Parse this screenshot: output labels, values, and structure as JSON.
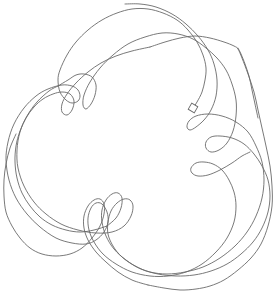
{
  "drawing": {
    "background": "#ffffff",
    "stroke_color": "#6a6a6a",
    "start_marker": {
      "shape": "square",
      "x": 193,
      "y": 108,
      "size": 7,
      "rotation": 30
    },
    "paths": [
      {
        "name": "top-arcs-to-left-loops",
        "points": [
          [
            193,
            108
          ],
          [
            197,
            102
          ],
          [
            202,
            92
          ],
          [
            205,
            80
          ],
          [
            206,
            68
          ],
          [
            203,
            55
          ],
          [
            197,
            42
          ],
          [
            188,
            30
          ],
          [
            177,
            20
          ],
          [
            163,
            13
          ],
          [
            148,
            9
          ],
          [
            132,
            9
          ],
          [
            117,
            13
          ],
          [
            102,
            20
          ],
          [
            88,
            30
          ],
          [
            76,
            42
          ],
          [
            67,
            55
          ],
          [
            60,
            70
          ],
          [
            58,
            80
          ],
          [
            60,
            92
          ],
          [
            66,
            100
          ],
          [
            72,
            103
          ],
          [
            78,
            101
          ],
          [
            80,
            96
          ],
          [
            78,
            90
          ],
          [
            72,
            86
          ],
          [
            62,
            85
          ],
          [
            48,
            89
          ],
          [
            36,
            96
          ],
          [
            24,
            108
          ],
          [
            14,
            124
          ],
          [
            8,
            142
          ],
          [
            6,
            160
          ],
          [
            9,
            180
          ],
          [
            16,
            198
          ],
          [
            27,
            214
          ],
          [
            40,
            227
          ],
          [
            56,
            238
          ],
          [
            72,
            243
          ],
          [
            86,
            244
          ],
          [
            96,
            240
          ],
          [
            104,
            232
          ],
          [
            108,
            222
          ],
          [
            107,
            212
          ],
          [
            102,
            204
          ],
          [
            96,
            203
          ],
          [
            91,
            208
          ],
          [
            88,
            218
          ],
          [
            89,
            230
          ],
          [
            94,
            242
          ],
          [
            103,
            254
          ],
          [
            116,
            264
          ],
          [
            132,
            272
          ],
          [
            150,
            276
          ],
          [
            168,
            276
          ],
          [
            186,
            272
          ],
          [
            202,
            264
          ],
          [
            216,
            252
          ],
          [
            227,
            238
          ],
          [
            234,
            222
          ],
          [
            236,
            206
          ],
          [
            234,
            192
          ],
          [
            229,
            180
          ],
          [
            222,
            170
          ],
          [
            213,
            164
          ],
          [
            204,
            162
          ],
          [
            196,
            163
          ],
          [
            191,
            168
          ],
          [
            192,
            173
          ],
          [
            198,
            176
          ],
          [
            208,
            175
          ],
          [
            220,
            170
          ],
          [
            232,
            163
          ],
          [
            242,
            156
          ],
          [
            250,
            152
          ]
        ]
      },
      {
        "name": "second-sweep",
        "points": [
          [
            125,
            4
          ],
          [
            140,
            4
          ],
          [
            156,
            7
          ],
          [
            172,
            14
          ],
          [
            186,
            24
          ],
          [
            198,
            36
          ],
          [
            208,
            50
          ],
          [
            214,
            64
          ],
          [
            217,
            80
          ],
          [
            216,
            96
          ],
          [
            211,
            110
          ],
          [
            204,
            120
          ],
          [
            196,
            127
          ],
          [
            190,
            130
          ],
          [
            187,
            127
          ],
          [
            189,
            121
          ],
          [
            196,
            116
          ],
          [
            208,
            114
          ],
          [
            222,
            116
          ],
          [
            236,
            122
          ],
          [
            248,
            132
          ],
          [
            256,
            146
          ],
          [
            262,
            162
          ],
          [
            264,
            180
          ],
          [
            262,
            198
          ],
          [
            256,
            216
          ],
          [
            247,
            232
          ],
          [
            235,
            246
          ],
          [
            220,
            258
          ],
          [
            203,
            267
          ],
          [
            185,
            272
          ],
          [
            167,
            274
          ],
          [
            150,
            272
          ],
          [
            135,
            266
          ],
          [
            122,
            257
          ],
          [
            113,
            246
          ],
          [
            108,
            234
          ],
          [
            108,
            222
          ],
          [
            111,
            211
          ],
          [
            117,
            203
          ],
          [
            124,
            199
          ],
          [
            130,
            200
          ],
          [
            133,
            206
          ],
          [
            131,
            216
          ],
          [
            124,
            226
          ],
          [
            112,
            232
          ],
          [
            96,
            233
          ],
          [
            78,
            230
          ],
          [
            61,
            224
          ],
          [
            46,
            214
          ],
          [
            34,
            202
          ],
          [
            24,
            186
          ],
          [
            18,
            168
          ],
          [
            17,
            150
          ],
          [
            20,
            132
          ],
          [
            27,
            116
          ],
          [
            37,
            102
          ],
          [
            49,
            91
          ],
          [
            58,
            86
          ]
        ]
      },
      {
        "name": "third-sweep",
        "points": [
          [
            58,
            86
          ],
          [
            68,
            80
          ],
          [
            76,
            75
          ],
          [
            84,
            74
          ],
          [
            92,
            77
          ],
          [
            96,
            85
          ],
          [
            95,
            95
          ],
          [
            91,
            104
          ],
          [
            86,
            109
          ],
          [
            83,
            105
          ],
          [
            84,
            95
          ],
          [
            90,
            82
          ],
          [
            100,
            68
          ],
          [
            113,
            55
          ],
          [
            128,
            44
          ],
          [
            145,
            37
          ],
          [
            162,
            33
          ],
          [
            178,
            34
          ],
          [
            193,
            39
          ],
          [
            206,
            48
          ],
          [
            217,
            58
          ],
          [
            226,
            70
          ],
          [
            232,
            84
          ],
          [
            236,
            100
          ],
          [
            236,
            116
          ],
          [
            233,
            131
          ],
          [
            227,
            143
          ],
          [
            219,
            150
          ],
          [
            211,
            152
          ],
          [
            206,
            148
          ],
          [
            206,
            142
          ],
          [
            211,
            137
          ],
          [
            220,
            136
          ],
          [
            232,
            138
          ],
          [
            244,
            144
          ],
          [
            254,
            154
          ],
          [
            262,
            166
          ],
          [
            268,
            180
          ],
          [
            270,
            196
          ],
          [
            268,
            212
          ],
          [
            262,
            228
          ],
          [
            253,
            242
          ],
          [
            241,
            254
          ],
          [
            227,
            264
          ],
          [
            211,
            271
          ],
          [
            194,
            275
          ],
          [
            176,
            276
          ],
          [
            158,
            274
          ],
          [
            141,
            269
          ],
          [
            126,
            260
          ],
          [
            114,
            249
          ],
          [
            106,
            236
          ],
          [
            102,
            222
          ],
          [
            102,
            210
          ],
          [
            106,
            200
          ],
          [
            112,
            194
          ],
          [
            118,
            193
          ],
          [
            122,
            198
          ],
          [
            121,
            208
          ],
          [
            116,
            218
          ],
          [
            107,
            226
          ]
        ]
      },
      {
        "name": "left-inner-loops",
        "points": [
          [
            107,
            226
          ],
          [
            94,
            230
          ],
          [
            80,
            232
          ],
          [
            66,
            230
          ],
          [
            52,
            225
          ],
          [
            40,
            217
          ],
          [
            30,
            206
          ],
          [
            22,
            193
          ],
          [
            17,
            178
          ],
          [
            15,
            162
          ],
          [
            16,
            146
          ],
          [
            20,
            131
          ],
          [
            26,
            118
          ],
          [
            34,
            107
          ],
          [
            43,
            99
          ],
          [
            53,
            94
          ],
          [
            62,
            92
          ],
          [
            70,
            94
          ],
          [
            74,
            101
          ],
          [
            72,
            110
          ],
          [
            67,
            115
          ],
          [
            62,
            112
          ],
          [
            62,
            104
          ],
          [
            67,
            94
          ],
          [
            76,
            83
          ],
          [
            88,
            72
          ],
          [
            101,
            63
          ],
          [
            116,
            56
          ],
          [
            132,
            51
          ],
          [
            150,
            47
          ]
        ]
      },
      {
        "name": "outer-right-arc",
        "points": [
          [
            150,
            47
          ],
          [
            165,
            42
          ],
          [
            180,
            38
          ],
          [
            195,
            36
          ],
          [
            210,
            38
          ],
          [
            224,
            42
          ],
          [
            234,
            46
          ],
          [
            238,
            49
          ],
          [
            242,
            58
          ],
          [
            248,
            74
          ],
          [
            254,
            92
          ],
          [
            258,
            110
          ],
          [
            262,
            128
          ],
          [
            266,
            146
          ],
          [
            270,
            166
          ],
          [
            272,
            186
          ],
          [
            272,
            206
          ],
          [
            268,
            226
          ],
          [
            261,
            244
          ],
          [
            251,
            258
          ],
          [
            238,
            270
          ],
          [
            224,
            280
          ],
          [
            210,
            286
          ],
          [
            196,
            289
          ],
          [
            180,
            290
          ],
          [
            164,
            288
          ],
          [
            148,
            285
          ]
        ]
      },
      {
        "name": "bottom-loops",
        "points": [
          [
            148,
            285
          ],
          [
            132,
            280
          ],
          [
            118,
            272
          ],
          [
            106,
            262
          ],
          [
            96,
            252
          ],
          [
            88,
            240
          ],
          [
            84,
            228
          ],
          [
            84,
            216
          ],
          [
            88,
            206
          ],
          [
            94,
            200
          ],
          [
            100,
            199
          ],
          [
            104,
            204
          ],
          [
            104,
            214
          ],
          [
            100,
            226
          ],
          [
            92,
            238
          ],
          [
            82,
            248
          ],
          [
            70,
            254
          ],
          [
            56,
            256
          ],
          [
            42,
            254
          ],
          [
            30,
            248
          ],
          [
            20,
            238
          ],
          [
            12,
            226
          ],
          [
            6,
            212
          ],
          [
            4,
            196
          ],
          [
            4,
            180
          ],
          [
            6,
            164
          ],
          [
            10,
            148
          ],
          [
            16,
            134
          ]
        ]
      },
      {
        "name": "end-tail",
        "points": [
          [
            238,
            48
          ],
          [
            241,
            54
          ],
          [
            245,
            64
          ],
          [
            249,
            76
          ],
          [
            252,
            90
          ],
          [
            255,
            104
          ],
          [
            258,
            118
          ]
        ]
      }
    ]
  }
}
